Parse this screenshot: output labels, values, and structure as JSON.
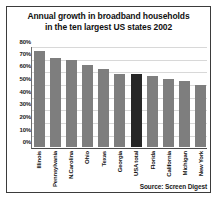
{
  "chart_data": {
    "type": "bar",
    "title": "Annual growth in broadband households in the ten largest US states 2002",
    "title_lines": [
      "Annual growth in broadband households",
      "in the ten largest US states 2002"
    ],
    "xlabel": "",
    "ylabel": "",
    "ylim": [
      0,
      80
    ],
    "ytick_labels": [
      "80%",
      "70%",
      "60%",
      "50%",
      "40%",
      "30%",
      "20%",
      "10%",
      "0%"
    ],
    "ytick_values": [
      80,
      70,
      60,
      50,
      40,
      30,
      20,
      10,
      0
    ],
    "grid": true,
    "legend": "none",
    "categories": [
      "Illinois",
      "Pennsylvania",
      "N.Carolina",
      "Ohio",
      "Texas",
      "Georgia",
      "USA total",
      "Florida",
      "California",
      "Michigan",
      "New York"
    ],
    "values": [
      75,
      70,
      68,
      64,
      61,
      57,
      57,
      56,
      53,
      52,
      49
    ],
    "highlight_category": "USA total",
    "colors": {
      "bar": "#7e7e7e",
      "highlight_bar": "#262626",
      "gridline": "#d8d8d8",
      "axis": "#4a4a4a",
      "text": "#151515",
      "background": "#ffffff",
      "border": "#3b3b3b"
    },
    "source": "Source: Screen Digest"
  }
}
